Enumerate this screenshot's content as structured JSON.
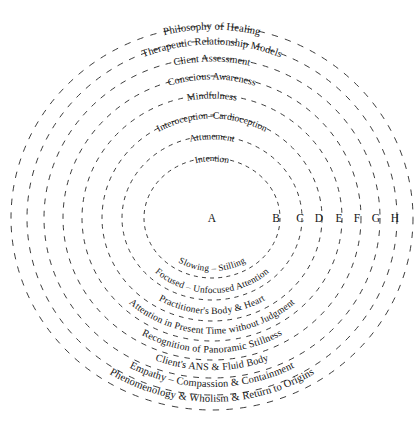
{
  "figure": {
    "type": "concentric-circles",
    "background_color": "#ffffff",
    "stroke_color": "#1a1a1a",
    "text_color": "#141414",
    "center": {
      "x": 212,
      "y": 218
    },
    "ring_count": 8,
    "stroke_style": "dashed"
  },
  "zone_letters": [
    {
      "id": "A",
      "label": "A",
      "x": 212,
      "y": 222
    },
    {
      "id": "B",
      "label": "B",
      "x": 276,
      "y": 222
    },
    {
      "id": "C",
      "label": "C",
      "x": 300,
      "y": 222
    },
    {
      "id": "D",
      "label": "D",
      "x": 319,
      "y": 222
    },
    {
      "id": "E",
      "label": "E",
      "x": 339,
      "y": 222
    },
    {
      "id": "F",
      "label": "F",
      "x": 357,
      "y": 222
    },
    {
      "id": "G",
      "label": "G",
      "x": 376,
      "y": 222
    },
    {
      "id": "H",
      "label": "H",
      "x": 395,
      "y": 222
    }
  ],
  "rings": [
    {
      "index": 1,
      "letter": "B",
      "rx": 68,
      "ry": 60,
      "font_size": 9.2,
      "top_label": "Intention",
      "bottom_label": "Slowing – Stilling"
    },
    {
      "index": 2,
      "letter": "C",
      "rx": 90,
      "ry": 82,
      "font_size": 9.4,
      "top_label": "Attunement",
      "bottom_label": "Focused – Unfocused Attention"
    },
    {
      "index": 3,
      "letter": "D",
      "rx": 110,
      "ry": 103,
      "font_size": 9.6,
      "top_label": "Interoception–Cardioception",
      "bottom_label": "Practitioner's Body & Heart"
    },
    {
      "index": 4,
      "letter": "E",
      "rx": 130,
      "ry": 123,
      "font_size": 9.8,
      "top_label": "Mindfulness",
      "bottom_label": "Attention in Present Time without Judgment"
    },
    {
      "index": 5,
      "letter": "F",
      "rx": 149,
      "ry": 142,
      "font_size": 10.0,
      "top_label": "Conscious Awareness",
      "bottom_label": "Recognition of Panoramic Stillness"
    },
    {
      "index": 6,
      "letter": "G",
      "rx": 168,
      "ry": 160,
      "font_size": 10.2,
      "top_label": "Client Assessment",
      "bottom_label": "Client's ANS & Fluid Body"
    },
    {
      "index": 7,
      "letter": "H",
      "rx": 185,
      "ry": 177,
      "font_size": 10.4,
      "top_label": "Therapeutic Relationship Models",
      "bottom_label": "Empathy – Compassion & Containment"
    },
    {
      "index": 8,
      "letter": "",
      "rx": 201,
      "ry": 192,
      "font_size": 10.6,
      "top_label": "Philosophy of Healing",
      "bottom_label": "Phenomenology & Wholism & Return to Origins"
    }
  ]
}
